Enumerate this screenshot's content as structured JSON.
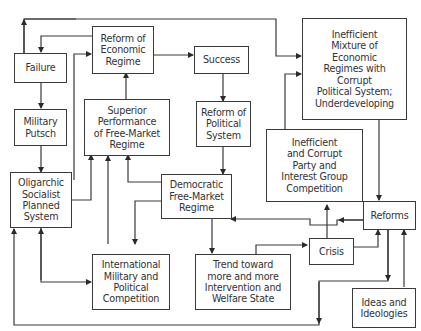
{
  "figure": {
    "label": "Figure 0.0"
  },
  "nodes": {
    "failure": "Failure",
    "military_putsch": "Military\nPutsch",
    "oligarchic": "Oligarchic\nSocialist\nPlanned\nSystem",
    "reform_econ": "Reform of\nEconomic\nRegime",
    "superior": "Superior\nPerformance\nof Free-Market\nRegime",
    "success": "Success",
    "reform_pol": "Reform of\nPolitical\nSystem",
    "democratic": "Democratic\nFree-Market\nRegime",
    "inefficient_mix": "Inefficient\nMixture of\nEconomic\nRegimes with\nCorrupt\nPolitical System;\nUnderdeveloping",
    "inefficient_party": "Inefficient\nand Corrupt\nParty and\nInterest Group\nCompetition",
    "international": "International\nMilitary and\nPolitical\nCompetition",
    "trend": "Trend toward\nmore and more\nIntervention and\nWelfare State",
    "crisis": "Crisis",
    "reforms": "Reforms",
    "ideas": "Ideas and\nIdeologies"
  },
  "colors": {
    "line": "#3a3a3a",
    "text": "#333333",
    "background": "#ffffff"
  }
}
